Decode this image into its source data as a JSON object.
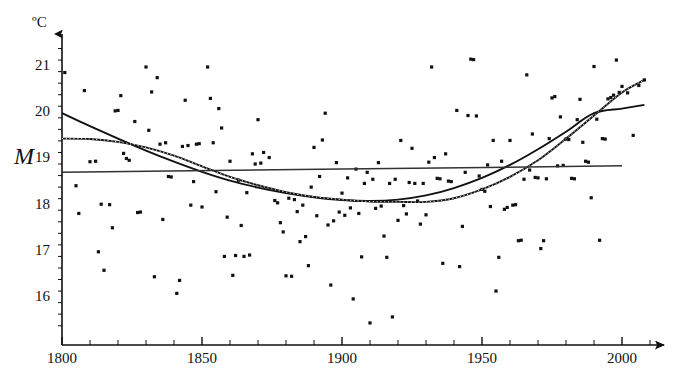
{
  "chart_data": {
    "type": "scatter",
    "title": "",
    "xlabel": "",
    "ylabel": "",
    "unit_label": "ºC",
    "xlim": [
      1800,
      2010
    ],
    "ylim": [
      15.4,
      21.6
    ],
    "grid": false,
    "legend": "none",
    "x_ticks_major": [
      1800,
      1850,
      1900,
      1950,
      2000
    ],
    "x_tick_labels": [
      "1800",
      "1850",
      "1900",
      "1950",
      "2000"
    ],
    "x_tick_minor_step": 10,
    "y_ticks_major": [
      16,
      17,
      18,
      19,
      20,
      21
    ],
    "y_tick_labels": [
      "16",
      "17",
      "18",
      "19",
      "20",
      "21"
    ],
    "y_tick_minor_step": 0.25,
    "annotations": [
      {
        "name": "mean-line-label",
        "text": "M",
        "value": 18.72,
        "description": "italic M marking the horizontal mean reference line"
      }
    ],
    "series": [
      {
        "name": "annual-temperature-observations",
        "type": "scatter",
        "marker": "square",
        "color": "#111111",
        "points": [
          [
            1801,
            20.88
          ],
          [
            1805,
            18.43
          ],
          [
            1806,
            17.83
          ],
          [
            1808,
            20.49
          ],
          [
            1810,
            18.95
          ],
          [
            1812,
            18.96
          ],
          [
            1813,
            17.0
          ],
          [
            1814,
            18.03
          ],
          [
            1815,
            16.6
          ],
          [
            1817,
            18.02
          ],
          [
            1818,
            17.52
          ],
          [
            1819,
            20.05
          ],
          [
            1820,
            20.06
          ],
          [
            1821,
            20.38
          ],
          [
            1822,
            19.13
          ],
          [
            1823,
            19.02
          ],
          [
            1824,
            18.98
          ],
          [
            1826,
            19.82
          ],
          [
            1827,
            17.85
          ],
          [
            1828,
            17.86
          ],
          [
            1830,
            21.0
          ],
          [
            1831,
            19.63
          ],
          [
            1832,
            20.46
          ],
          [
            1833,
            16.46
          ],
          [
            1834,
            20.77
          ],
          [
            1835,
            19.33
          ],
          [
            1836,
            17.7
          ],
          [
            1837,
            19.36
          ],
          [
            1838,
            18.63
          ],
          [
            1839,
            18.62
          ],
          [
            1841,
            16.1
          ],
          [
            1842,
            16.38
          ],
          [
            1843,
            19.28
          ],
          [
            1844,
            20.28
          ],
          [
            1845,
            19.3
          ],
          [
            1846,
            18.01
          ],
          [
            1847,
            18.52
          ],
          [
            1848,
            19.33
          ],
          [
            1849,
            19.34
          ],
          [
            1850,
            17.97
          ],
          [
            1852,
            21.0
          ],
          [
            1853,
            20.32
          ],
          [
            1854,
            19.36
          ],
          [
            1855,
            18.3
          ],
          [
            1856,
            20.1
          ],
          [
            1857,
            19.68
          ],
          [
            1858,
            16.9
          ],
          [
            1859,
            17.75
          ],
          [
            1860,
            18.96
          ],
          [
            1861,
            16.49
          ],
          [
            1862,
            16.92
          ],
          [
            1863,
            18.55
          ],
          [
            1864,
            17.57
          ],
          [
            1865,
            16.9
          ],
          [
            1866,
            18.28
          ],
          [
            1867,
            16.93
          ],
          [
            1868,
            19.12
          ],
          [
            1869,
            18.9
          ],
          [
            1870,
            19.86
          ],
          [
            1871,
            18.92
          ],
          [
            1872,
            19.15
          ],
          [
            1874,
            19.04
          ],
          [
            1876,
            18.11
          ],
          [
            1877,
            18.06
          ],
          [
            1878,
            17.63
          ],
          [
            1879,
            17.43
          ],
          [
            1880,
            16.48
          ],
          [
            1881,
            18.16
          ],
          [
            1882,
            16.47
          ],
          [
            1883,
            18.13
          ],
          [
            1884,
            17.87
          ],
          [
            1885,
            17.22
          ],
          [
            1886,
            18.01
          ],
          [
            1887,
            17.33
          ],
          [
            1888,
            16.7
          ],
          [
            1889,
            18.4
          ],
          [
            1890,
            19.26
          ],
          [
            1891,
            17.78
          ],
          [
            1892,
            18.63
          ],
          [
            1893,
            19.42
          ],
          [
            1894,
            20.0
          ],
          [
            1895,
            17.58
          ],
          [
            1896,
            16.28
          ],
          [
            1897,
            17.67
          ],
          [
            1898,
            18.93
          ],
          [
            1899,
            17.86
          ],
          [
            1900,
            18.27
          ],
          [
            1901,
            17.79
          ],
          [
            1902,
            18.6
          ],
          [
            1903,
            17.95
          ],
          [
            1904,
            15.98
          ],
          [
            1905,
            18.79
          ],
          [
            1906,
            17.83
          ],
          [
            1907,
            16.89
          ],
          [
            1908,
            18.48
          ],
          [
            1909,
            18.72
          ],
          [
            1910,
            15.46
          ],
          [
            1911,
            18.57
          ],
          [
            1912,
            17.94
          ],
          [
            1913,
            18.93
          ],
          [
            1914,
            17.99
          ],
          [
            1915,
            17.34
          ],
          [
            1916,
            16.88
          ],
          [
            1917,
            18.48
          ],
          [
            1918,
            15.59
          ],
          [
            1919,
            18.57
          ],
          [
            1920,
            17.68
          ],
          [
            1921,
            19.41
          ],
          [
            1922,
            18.0
          ],
          [
            1923,
            17.82
          ],
          [
            1924,
            18.5
          ],
          [
            1925,
            19.24
          ],
          [
            1926,
            18.48
          ],
          [
            1927,
            18.1
          ],
          [
            1928,
            17.6
          ],
          [
            1929,
            18.48
          ],
          [
            1930,
            17.8
          ],
          [
            1931,
            18.94
          ],
          [
            1932,
            21.0
          ],
          [
            1933,
            19.04
          ],
          [
            1934,
            18.59
          ],
          [
            1935,
            18.58
          ],
          [
            1936,
            16.75
          ],
          [
            1937,
            19.12
          ],
          [
            1938,
            18.53
          ],
          [
            1939,
            18.52
          ],
          [
            1941,
            20.06
          ],
          [
            1942,
            16.68
          ],
          [
            1943,
            17.55
          ],
          [
            1944,
            18.72
          ],
          [
            1945,
            19.95
          ],
          [
            1946,
            21.17
          ],
          [
            1947,
            21.16
          ],
          [
            1948,
            19.94
          ],
          [
            1949,
            18.64
          ],
          [
            1950,
            18.35
          ],
          [
            1951,
            18.31
          ],
          [
            1952,
            18.88
          ],
          [
            1953,
            17.98
          ],
          [
            1954,
            19.41
          ],
          [
            1955,
            16.15
          ],
          [
            1956,
            16.88
          ],
          [
            1957,
            18.96
          ],
          [
            1958,
            17.92
          ],
          [
            1959,
            17.96
          ],
          [
            1960,
            19.41
          ],
          [
            1961,
            18.01
          ],
          [
            1962,
            18.02
          ],
          [
            1963,
            17.24
          ],
          [
            1964,
            17.25
          ],
          [
            1965,
            18.57
          ],
          [
            1966,
            20.83
          ],
          [
            1967,
            18.77
          ],
          [
            1968,
            19.55
          ],
          [
            1969,
            18.61
          ],
          [
            1970,
            18.6
          ],
          [
            1971,
            17.07
          ],
          [
            1972,
            17.24
          ],
          [
            1973,
            18.58
          ],
          [
            1974,
            19.45
          ],
          [
            1975,
            20.33
          ],
          [
            1976,
            20.36
          ],
          [
            1977,
            18.86
          ],
          [
            1978,
            19.92
          ],
          [
            1979,
            18.87
          ],
          [
            1980,
            19.44
          ],
          [
            1981,
            19.43
          ],
          [
            1982,
            18.59
          ],
          [
            1983,
            18.58
          ],
          [
            1984,
            19.86
          ],
          [
            1985,
            20.3
          ],
          [
            1986,
            19.37
          ],
          [
            1987,
            18.96
          ],
          [
            1988,
            18.94
          ],
          [
            1989,
            18.17
          ],
          [
            1990,
            21.01
          ],
          [
            1991,
            19.87
          ],
          [
            1992,
            17.25
          ],
          [
            1993,
            19.45
          ],
          [
            1994,
            19.44
          ],
          [
            1995,
            20.31
          ],
          [
            1996,
            20.34
          ],
          [
            1997,
            20.39
          ],
          [
            1998,
            21.15
          ],
          [
            1999,
            20.45
          ],
          [
            2000,
            20.58
          ],
          [
            2002,
            20.44
          ],
          [
            2004,
            19.52
          ],
          [
            2006,
            20.6
          ],
          [
            2008,
            20.72
          ]
        ]
      },
      {
        "name": "parabolic-trend-curve",
        "type": "line",
        "style": "solid",
        "color": "#111111",
        "description": "solid quadratic fit, starts 20.0 at 1800, minimum near 1905",
        "points": [
          [
            1800,
            20.0
          ],
          [
            1810,
            19.72
          ],
          [
            1820,
            19.45
          ],
          [
            1830,
            19.19
          ],
          [
            1840,
            18.95
          ],
          [
            1850,
            18.73
          ],
          [
            1860,
            18.54
          ],
          [
            1870,
            18.39
          ],
          [
            1880,
            18.27
          ],
          [
            1890,
            18.18
          ],
          [
            1900,
            18.12
          ],
          [
            1910,
            18.1
          ],
          [
            1920,
            18.13
          ],
          [
            1930,
            18.22
          ],
          [
            1940,
            18.38
          ],
          [
            1950,
            18.6
          ],
          [
            1960,
            18.88
          ],
          [
            1970,
            19.22
          ],
          [
            1980,
            19.6
          ],
          [
            1990,
            20.0
          ],
          [
            2000,
            20.1
          ],
          [
            2008,
            20.18
          ]
        ]
      },
      {
        "name": "dotted-polynomial-trend-curve",
        "type": "line",
        "style": "dotted",
        "color": "#111111",
        "description": "dotted higher-order fit, starts 19.45 at 1800, flat minimum 1900-1930, steep rise after 1960",
        "points": [
          [
            1800,
            19.45
          ],
          [
            1810,
            19.44
          ],
          [
            1820,
            19.38
          ],
          [
            1830,
            19.26
          ],
          [
            1840,
            19.08
          ],
          [
            1850,
            18.85
          ],
          [
            1860,
            18.62
          ],
          [
            1870,
            18.44
          ],
          [
            1880,
            18.29
          ],
          [
            1890,
            18.19
          ],
          [
            1900,
            18.13
          ],
          [
            1910,
            18.09
          ],
          [
            1920,
            18.08
          ],
          [
            1930,
            18.08
          ],
          [
            1940,
            18.16
          ],
          [
            1950,
            18.35
          ],
          [
            1960,
            18.62
          ],
          [
            1970,
            18.98
          ],
          [
            1980,
            19.45
          ],
          [
            1990,
            19.95
          ],
          [
            2000,
            20.45
          ],
          [
            2008,
            20.72
          ]
        ]
      },
      {
        "name": "mean-reference-line",
        "type": "line",
        "style": "solid",
        "color": "#333333",
        "description": "near-horizontal overall mean line labelled M",
        "points": [
          [
            1800,
            18.72
          ],
          [
            2000,
            18.86
          ]
        ]
      }
    ]
  },
  "axes": {
    "y_axis_name": "temperature-axis",
    "x_axis_name": "year-axis",
    "y_arrow": true,
    "x_arrow": true
  }
}
